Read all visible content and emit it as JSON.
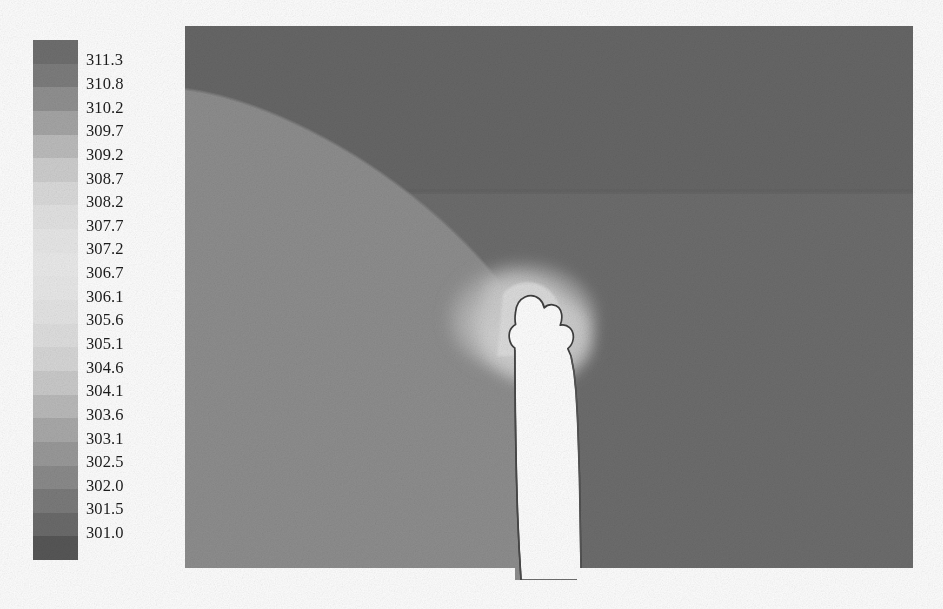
{
  "figure": {
    "type": "filled-contour-plot",
    "background_color": "#ffffff"
  },
  "colorbar": {
    "name": "temperature-colorbar",
    "orientation": "vertical",
    "x": 33,
    "y": 40,
    "width": 45,
    "height": 520,
    "band_count": 22,
    "label_font": "serif",
    "label_font_size": 16.5,
    "tick_labels": [
      "311.3",
      "310.8",
      "310.2",
      "309.7",
      "309.2",
      "308.7",
      "308.2",
      "307.7",
      "307.2",
      "306.7",
      "306.1",
      "305.6",
      "305.1",
      "304.6",
      "304.1",
      "303.6",
      "303.1",
      "302.5",
      "302.0",
      "301.5",
      "301.0"
    ],
    "band_colors": [
      "#6f6f6f",
      "#7d7d7d",
      "#919191",
      "#a6a6a6",
      "#bdbdbd",
      "#cfcfcf",
      "#dcdcdc",
      "#e4e4e4",
      "#e9e9e9",
      "#ececec",
      "#eaeaea",
      "#e6e6e6",
      "#e0e0e0",
      "#d8d8d8",
      "#cbcbcb",
      "#bbbbbb",
      "#aaaaaa",
      "#9a9a9a",
      "#8b8b8b",
      "#7b7b7b",
      "#6b6b6b",
      "#575757"
    ],
    "value_max": "311.3",
    "value_min": "301.0",
    "value_step": "0.5"
  },
  "plot": {
    "name": "contour-field",
    "x": 185,
    "y": 26,
    "width": 728,
    "height": 554,
    "regions": [
      {
        "name": "upper-right-dark-region",
        "fill": "#676767",
        "value_label": "301.5"
      },
      {
        "name": "upper-right-band-lighter",
        "fill": "#6c6c6c",
        "value_label": "302.0"
      },
      {
        "name": "lower-left-light-region",
        "fill": "#8e8e8e",
        "value_label": "303.1"
      },
      {
        "name": "cavity-halo-light",
        "fill": "#c8c8c8",
        "value_label": "305.6"
      },
      {
        "name": "cavity-void",
        "fill": "#ffffff",
        "value_label": "no-data"
      }
    ],
    "contour_line_color": "#3a3a3a"
  },
  "chart_data": {
    "type": "heatmap",
    "title": "",
    "xlabel": "",
    "ylabel": "",
    "colorbar_label": "",
    "legend_position": "left",
    "grid": false,
    "colormap": "grayscale-nonmonotonic",
    "levels": [
      301.0,
      301.5,
      302.0,
      302.5,
      303.1,
      303.6,
      304.1,
      304.6,
      305.1,
      305.6,
      306.1,
      306.7,
      307.2,
      307.7,
      308.2,
      308.7,
      309.2,
      309.7,
      310.2,
      310.8,
      311.3
    ],
    "zlim": [
      301.0,
      311.3
    ],
    "level_step": 0.5,
    "tick_count": 21,
    "band_count": 22,
    "annotations": [
      "dark region occupies upper-right of the domain",
      "lighter region occupies lower-left of the domain",
      "white cavity with crown-shaped top near horizontal center",
      "stepped vertical cavity walls",
      "bottom boundary is staggered: left block extends lower than right block"
    ]
  }
}
